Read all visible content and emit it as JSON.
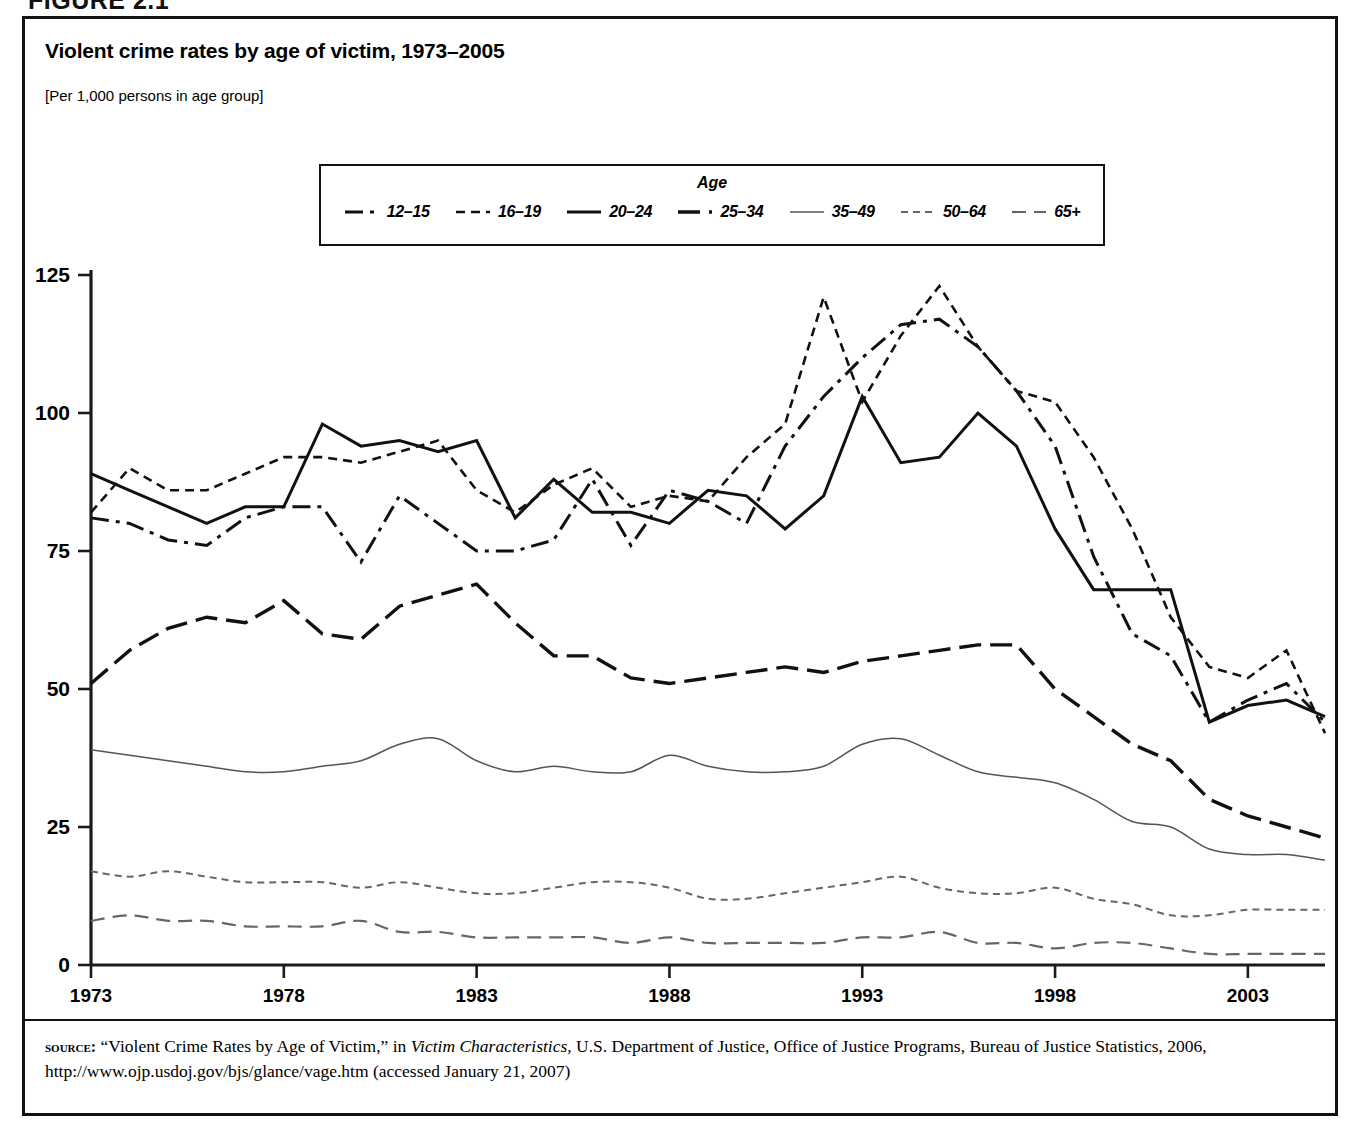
{
  "figure": {
    "number_label": "FIGURE 2.1",
    "title": "Violent crime rates by age of victim, 1973–2005",
    "units": "[Per 1,000 persons in age group]"
  },
  "legend": {
    "title": "Age",
    "items": [
      {
        "label": "12–15",
        "style": "dash-dot",
        "color": "#111111",
        "width": 3.0
      },
      {
        "label": "16–19",
        "style": "dotted-short",
        "color": "#111111",
        "width": 2.6
      },
      {
        "label": "20–24",
        "style": "solid",
        "color": "#111111",
        "width": 3.0
      },
      {
        "label": "25–34",
        "style": "dashed-long",
        "color": "#111111",
        "width": 3.4
      },
      {
        "label": "35–49",
        "style": "solid-thin",
        "color": "#555555",
        "width": 1.5
      },
      {
        "label": "50–64",
        "style": "dotted-fine",
        "color": "#666666",
        "width": 2.0
      },
      {
        "label": "65+",
        "style": "dashed-medium",
        "color": "#666666",
        "width": 2.2
      }
    ]
  },
  "axes": {
    "y_ticks": [
      "0",
      "25",
      "50",
      "75",
      "100",
      "125"
    ],
    "x_ticks": [
      "1973",
      "1978",
      "1983",
      "1988",
      "1993",
      "1998",
      "2003"
    ],
    "y_min": 0,
    "y_max": 125,
    "x_min": 1973,
    "x_max": 2005
  },
  "source": {
    "label": "source:",
    "text_before_italic": " “Violent Crime Rates by Age of Victim,” in ",
    "italic_title": "Victim Characteristics,",
    "text_after_italic": "  U.S. Department of Justice, Office of Justice Programs, Bureau of Justice Statistics, 2006, http://www.ojp.usdoj.gov/bjs/glance/vage.htm (accessed January 21, 2007)"
  },
  "chart_data": {
    "type": "line",
    "title": "Violent crime rates by age of victim, 1973–2005",
    "subtitle": "[Per 1,000 persons in age group]",
    "xlabel": "",
    "ylabel": "Rate per 1,000 persons in age group",
    "xlim": [
      1973,
      2005
    ],
    "ylim": [
      0,
      125
    ],
    "grid": false,
    "legend_position": "top-center",
    "legend_title": "Age",
    "x": [
      1973,
      1974,
      1975,
      1976,
      1977,
      1978,
      1979,
      1980,
      1981,
      1982,
      1983,
      1984,
      1985,
      1986,
      1987,
      1988,
      1989,
      1990,
      1991,
      1992,
      1993,
      1994,
      1995,
      1996,
      1997,
      1998,
      1999,
      2000,
      2001,
      2002,
      2003,
      2004,
      2005
    ],
    "series": [
      {
        "name": "12–15",
        "style": "dash-dot",
        "values": [
          81,
          80,
          77,
          76,
          81,
          83,
          83,
          73,
          85,
          80,
          75,
          75,
          77,
          88,
          76,
          86,
          84,
          80,
          94,
          103,
          110,
          116,
          117,
          112,
          104,
          94,
          74,
          60,
          56,
          44,
          48,
          51,
          44
        ]
      },
      {
        "name": "16–19",
        "style": "dotted-short",
        "values": [
          82,
          90,
          86,
          86,
          89,
          92,
          92,
          91,
          93,
          95,
          86,
          82,
          87,
          90,
          83,
          85,
          84,
          92,
          98,
          121,
          102,
          114,
          123,
          112,
          104,
          102,
          92,
          79,
          63,
          54,
          52,
          57,
          42
        ]
      },
      {
        "name": "20–24",
        "style": "solid",
        "values": [
          89,
          86,
          83,
          80,
          83,
          83,
          98,
          94,
          95,
          93,
          95,
          81,
          88,
          82,
          82,
          80,
          86,
          85,
          79,
          85,
          103,
          91,
          92,
          100,
          94,
          79,
          68,
          68,
          68,
          44,
          47,
          48,
          45
        ]
      },
      {
        "name": "25–34",
        "style": "dashed-long",
        "values": [
          51,
          57,
          61,
          63,
          62,
          66,
          60,
          59,
          65,
          67,
          69,
          62,
          56,
          56,
          52,
          51,
          52,
          53,
          54,
          53,
          55,
          56,
          57,
          58,
          58,
          50,
          45,
          40,
          37,
          30,
          27,
          25,
          23
        ]
      },
      {
        "name": "35–49",
        "style": "solid-thin",
        "values": [
          39,
          38,
          37,
          36,
          35,
          35,
          36,
          37,
          40,
          41,
          37,
          35,
          36,
          35,
          35,
          38,
          36,
          35,
          35,
          36,
          40,
          41,
          38,
          35,
          34,
          33,
          30,
          26,
          25,
          21,
          20,
          20,
          19
        ]
      },
      {
        "name": "50–64",
        "style": "dotted-fine",
        "values": [
          17,
          16,
          17,
          16,
          15,
          15,
          15,
          14,
          15,
          14,
          13,
          13,
          14,
          15,
          15,
          14,
          12,
          12,
          13,
          14,
          15,
          16,
          14,
          13,
          13,
          14,
          12,
          11,
          9,
          9,
          10,
          10,
          10
        ]
      },
      {
        "name": "65+",
        "style": "dashed-medium",
        "values": [
          8,
          9,
          8,
          8,
          7,
          7,
          7,
          8,
          6,
          6,
          5,
          5,
          5,
          5,
          4,
          5,
          4,
          4,
          4,
          4,
          5,
          5,
          6,
          4,
          4,
          3,
          4,
          4,
          3,
          2,
          2,
          2,
          2
        ]
      }
    ]
  }
}
